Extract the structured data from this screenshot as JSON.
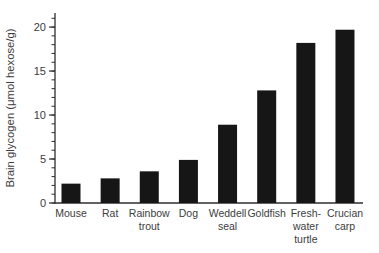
{
  "chart_data": {
    "type": "bar",
    "title": "",
    "xlabel": "",
    "ylabel": "Brain glycogen (μmol hexose/g)",
    "categories": [
      "Mouse",
      "Rat",
      "Rainbow trout",
      "Dog",
      "Weddell seal",
      "Goldfish",
      "Fresh-water turtle",
      "Crucian carp"
    ],
    "category_label_lines": [
      [
        "Mouse"
      ],
      [
        "Rat"
      ],
      [
        "Rainbow",
        "trout"
      ],
      [
        "Dog"
      ],
      [
        "Weddell",
        "seal"
      ],
      [
        "Goldfish"
      ],
      [
        "Fresh-",
        "water",
        "turtle"
      ],
      [
        "Crucian",
        "carp"
      ]
    ],
    "values": [
      2.2,
      2.8,
      3.6,
      4.9,
      8.9,
      12.8,
      18.2,
      19.7
    ],
    "ylim": [
      0,
      21.6
    ],
    "yticks_major": [
      0,
      5,
      10,
      15,
      20
    ],
    "ytick_minor_step": 1,
    "grid": false,
    "legend_position": "none",
    "bar_color": "#161616",
    "axis_color": "#2e2e2e",
    "text_color": "#3d3d3d"
  }
}
